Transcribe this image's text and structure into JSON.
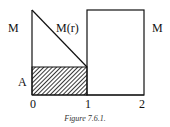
{
  "figure": {
    "caption": "Figure 7.6.1.",
    "labels": {
      "left_M": "M",
      "right_M": "M",
      "curve": "M(r)",
      "area": "A"
    },
    "x_ticks": [
      "0",
      "1",
      "2"
    ]
  }
}
